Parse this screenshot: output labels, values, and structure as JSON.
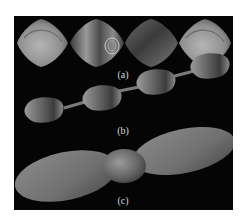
{
  "figure": {
    "background": "#050505",
    "page_background": "#ffffff",
    "subfigures": [
      {
        "id": "a",
        "label": "(a)",
        "description": "Row of four rounded rhombus-shaped 3D surfaces"
      },
      {
        "id": "b",
        "label": "(b)",
        "description": "Twisted chain of four bulges linked by thin necks"
      },
      {
        "id": "c",
        "label": "(c)",
        "description": "Propeller-like shape: two large ellipsoidal lobes joined by a small central blob"
      }
    ]
  }
}
